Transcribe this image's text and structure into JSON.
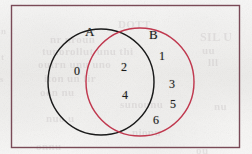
{
  "figure": {
    "type": "venn-diagram",
    "frame": {
      "name": "universal-set-frame",
      "color": "#7a4a57"
    },
    "sets": [
      {
        "id": "A",
        "label": "A",
        "color": "#1a1a1a",
        "label_x": 85,
        "label_y": 24,
        "circle": {
          "cx": 101,
          "cy": 82,
          "r": 53
        }
      },
      {
        "id": "B",
        "label": "B",
        "color": "#c0394f",
        "label_x": 149,
        "label_y": 27,
        "circle": {
          "cx": 140,
          "cy": 82,
          "r": 54
        }
      }
    ],
    "regions": [
      {
        "name": "a-only",
        "description": "elements in A but not in B",
        "elements": [
          {
            "value": "0",
            "x": 74,
            "y": 64
          }
        ]
      },
      {
        "name": "a-intersect-b",
        "description": "elements in both A and B",
        "elements": [
          {
            "value": "2",
            "x": 121,
            "y": 60
          },
          {
            "value": "4",
            "x": 122,
            "y": 88
          }
        ]
      },
      {
        "name": "b-only",
        "description": "elements in B but not in A",
        "elements": [
          {
            "value": "1",
            "x": 159,
            "y": 49
          },
          {
            "value": "3",
            "x": 169,
            "y": 77
          },
          {
            "value": "5",
            "x": 170,
            "y": 97
          },
          {
            "value": "6",
            "x": 153,
            "y": 113
          }
        ]
      }
    ],
    "bleed_text": [
      {
        "text": "n",
        "x": 1,
        "y": 26,
        "size": 9
      },
      {
        "text": "t",
        "x": 1,
        "y": 52,
        "size": 9
      },
      {
        "text": "s",
        "x": 0,
        "y": 74,
        "size": 9
      },
      {
        "text": "DOTT",
        "x": 118,
        "y": 18,
        "size": 11
      },
      {
        "text": "nr nroun",
        "x": 50,
        "y": 33,
        "size": 11
      },
      {
        "text": "tunorollut unu thi",
        "x": 42,
        "y": 45,
        "size": 11
      },
      {
        "text": "outrn unu uno",
        "x": 38,
        "y": 58,
        "size": 11
      },
      {
        "text": "iton un fir",
        "x": 44,
        "y": 72,
        "size": 11
      },
      {
        "text": "oon nu",
        "x": 40,
        "y": 86,
        "size": 11
      },
      {
        "text": "sunounu",
        "x": 120,
        "y": 98,
        "size": 11
      },
      {
        "text": "nuo u",
        "x": 46,
        "y": 112,
        "size": 11
      },
      {
        "text": "nionu",
        "x": 132,
        "y": 126,
        "size": 11
      },
      {
        "text": "onnu",
        "x": 36,
        "y": 140,
        "size": 11
      },
      {
        "text": "SIL U",
        "x": 200,
        "y": 30,
        "size": 12
      },
      {
        "text": "uu",
        "x": 202,
        "y": 44,
        "size": 11
      },
      {
        "text": "lll",
        "x": 208,
        "y": 56,
        "size": 11
      },
      {
        "text": "nu",
        "x": 214,
        "y": 100,
        "size": 11
      },
      {
        "text": "ou",
        "x": 196,
        "y": 144,
        "size": 11
      }
    ]
  }
}
